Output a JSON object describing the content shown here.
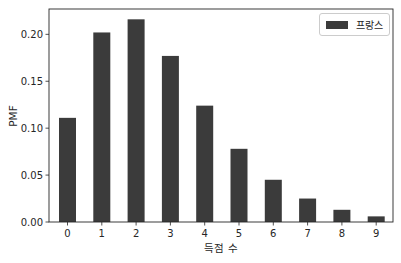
{
  "chart_data": {
    "type": "bar",
    "title": "",
    "xlabel": "득점 수",
    "ylabel": "PMF",
    "categories": [
      "0",
      "1",
      "2",
      "3",
      "4",
      "5",
      "6",
      "7",
      "8",
      "9"
    ],
    "series": [
      {
        "name": "프랑스",
        "color": "#3b3b3b",
        "values": [
          0.111,
          0.202,
          0.216,
          0.177,
          0.124,
          0.078,
          0.045,
          0.025,
          0.013,
          0.006
        ]
      }
    ],
    "ylim": [
      0,
      0.227
    ],
    "yticks": [
      "0.00",
      "0.05",
      "0.10",
      "0.15",
      "0.20"
    ],
    "ytick_values": [
      0,
      0.05,
      0.1,
      0.15,
      0.2
    ],
    "grid": false,
    "legend_position": "upper right"
  },
  "legend": {
    "label": "프랑스"
  },
  "axes": {
    "xlabel": "득점 수",
    "ylabel": "PMF"
  }
}
